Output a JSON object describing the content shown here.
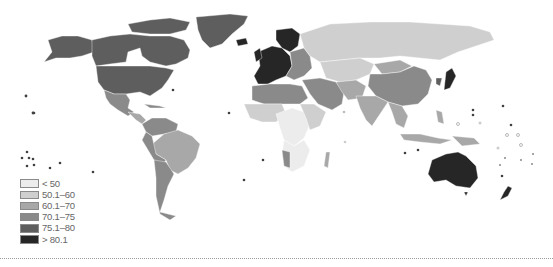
{
  "map": {
    "type": "choropleth-world-map",
    "color_scheme": "grayscale",
    "classes": [
      {
        "label": "< 50",
        "color": "#ececec"
      },
      {
        "label": "50.1–60",
        "color": "#cfcfcf"
      },
      {
        "label": "60.1–70",
        "color": "#a8a8a8"
      },
      {
        "label": "70.1–75",
        "color": "#8a8a8a"
      },
      {
        "label": "75.1–80",
        "color": "#5e5e5e"
      },
      {
        "label": "> 80.1",
        "color": "#262626"
      }
    ]
  },
  "legend": {
    "items": [
      {
        "label": "< 50",
        "color": "#ececec"
      },
      {
        "label": "50.1–60",
        "color": "#cfcfcf"
      },
      {
        "label": "60.1–70",
        "color": "#a8a8a8"
      },
      {
        "label": "70.1–75",
        "color": "#8a8a8a"
      },
      {
        "label": "75.1–80",
        "color": "#5e5e5e"
      },
      {
        "label": "> 80.1",
        "color": "#262626"
      }
    ]
  }
}
